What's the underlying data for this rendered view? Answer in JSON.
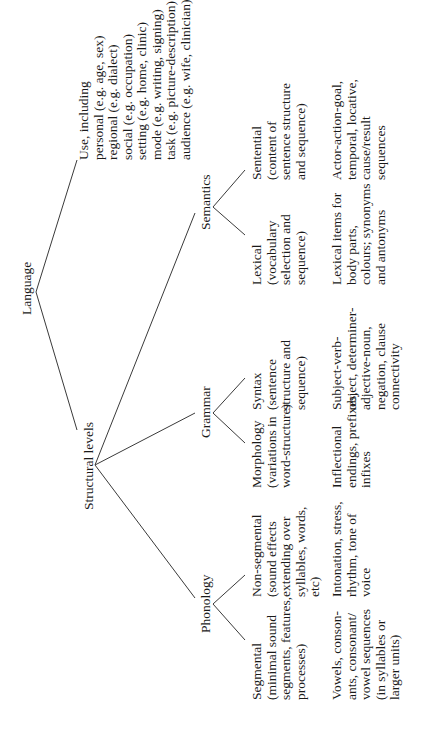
{
  "tree": {
    "root": "Language",
    "use": {
      "label": "Use, including",
      "items": [
        "personal (e.g. age, sex)",
        "regional (e.g. dialect)",
        "social (e.g. occupation)",
        "setting (e.g. home, clinic)",
        "mode (e.g. writing, signing)",
        "task (e.g. picture-description)",
        "audience (e.g. wife, clinician)"
      ]
    },
    "structural_levels": "Structural levels",
    "branches": [
      {
        "name": "Phonology",
        "children": [
          {
            "label": "Segmental\n(minimal sound\nsegments, features,\nprocesses)",
            "example": "Vowels, conson-\nants, consonant/\nvowel sequences\n(in syllables or\nlarger units)"
          },
          {
            "label": "Non-segmental\n(sound effects\nextending over\nsyllables, words,\netc)",
            "example": "Intonation, stress,\nrhythm, tone of\nvoice"
          }
        ]
      },
      {
        "name": "Grammar",
        "children": [
          {
            "label": "Morphology\n(variations in\nword-structure)",
            "example": "Inflectional\nendings, prefixes,\ninfixes"
          },
          {
            "label": "Syntax\n(sentence\nstructure and\nsequence)",
            "example": "Subject-verb-\nobject, determiner-\nadjective-noun,\nnegation, clause\nconnectivity"
          }
        ]
      },
      {
        "name": "Semantics",
        "children": [
          {
            "label": "Lexical\n(vocabulary\nselection and\nsequence)",
            "example": "Lexical items for\nbody parts,\ncolours; synonyms\nand antonyms"
          },
          {
            "label": "Sentential\n(content of\nsentence structure\nand sequence)",
            "example": "Actor-action-goal,\ntemporal, locative,\ncause/result\nsequences"
          }
        ]
      }
    ]
  }
}
